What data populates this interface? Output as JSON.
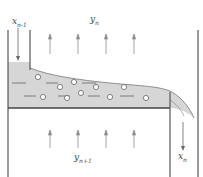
{
  "diagram": {
    "type": "distillation-tray-schematic",
    "colors": {
      "line": "#555555",
      "liquid": "#d6d6d6",
      "arrow": "#8a8a8a",
      "bubble_fill": "#ffffff"
    },
    "labels": {
      "liquid_in": {
        "base": "x",
        "sub": "n-1"
      },
      "vapor_out": {
        "base": "y",
        "sub": "n"
      },
      "vapor_in": {
        "base": "y",
        "sub": "n+1"
      },
      "liquid_out": {
        "base": "x",
        "sub": "n"
      }
    },
    "vapor_arrows_count_top": 4,
    "vapor_arrows_count_bottom": 4,
    "bubbles_count": 11
  }
}
